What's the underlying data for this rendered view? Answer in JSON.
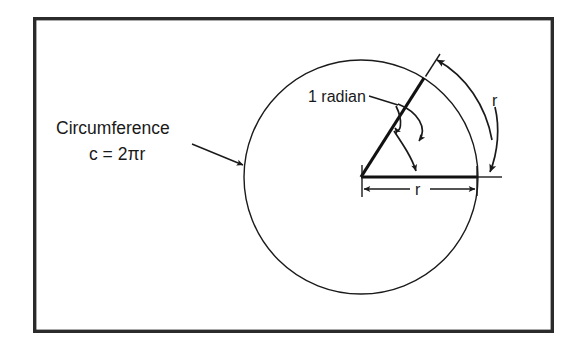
{
  "figure": {
    "background_color": "#ffffff",
    "ink_color": "#1a1a1a",
    "frame": {
      "name": "figure-border",
      "x": 33,
      "y": 17,
      "width": 521,
      "height": 316
    },
    "circle": {
      "name": "circle",
      "center_x": 361,
      "center_y": 177,
      "radius": 117
    },
    "labels": {
      "circumference": "Circumference",
      "formula": "c = 2πr",
      "radian": "1 radian",
      "arc_length_r": "r",
      "radius_r": "r"
    },
    "annotations": [
      {
        "name": "circumference-callout",
        "text": "Circumference",
        "second_line": "c = 2πr",
        "points_to": "circle-edge-left"
      },
      {
        "name": "radian-callout",
        "text": "1 radian",
        "points_to": "central-angle"
      },
      {
        "name": "arc-length-callout",
        "text": "r",
        "points_to": "arc-outside-circle"
      },
      {
        "name": "radius-dimension",
        "text": "r",
        "points_to": "horizontal-radius"
      }
    ]
  }
}
